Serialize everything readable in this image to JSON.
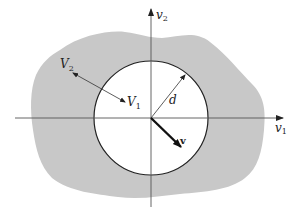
{
  "figure": {
    "labels": {
      "v2_axis": "v",
      "v2_axis_sub": "2",
      "v1_axis": "v",
      "v1_axis_sub": "1",
      "V2": "V",
      "V2_sub": "2",
      "V1": "V",
      "V1_sub": "1",
      "d": "d",
      "v": "v"
    },
    "colors": {
      "region_fill": "#c8c8c8",
      "circle_fill": "#ffffff",
      "stroke": "#222222"
    }
  }
}
